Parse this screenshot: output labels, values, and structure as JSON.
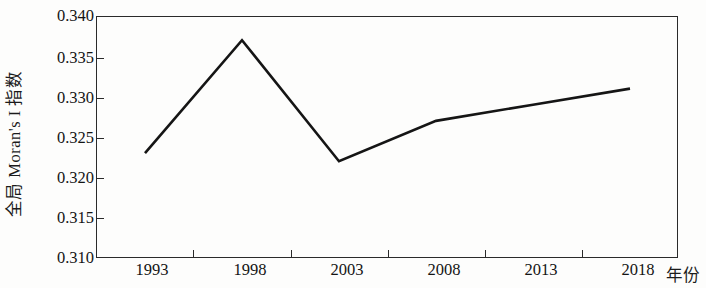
{
  "chart_data": {
    "type": "line",
    "title": "",
    "subtitle": "",
    "xlabel": "年份",
    "ylabel": "全局 Moran's I 指数",
    "x": [
      1993,
      1998,
      2003,
      2008,
      2013,
      2018
    ],
    "categories": [
      "1993",
      "1998",
      "2003",
      "2008",
      "2013",
      "2018"
    ],
    "values": [
      0.323,
      0.337,
      0.322,
      0.327,
      0.329,
      0.331
    ],
    "series": [
      {
        "name": "全局 Moran's I 指数",
        "values": [
          0.323,
          0.337,
          0.322,
          0.327,
          0.329,
          0.331
        ]
      }
    ],
    "ylim": [
      0.31,
      0.34
    ],
    "xlim": [
      1993,
      2018
    ],
    "yticks": [
      0.34,
      0.335,
      0.33,
      0.325,
      0.32,
      0.315,
      0.31
    ],
    "ytick_labels": [
      "0.340",
      "0.335",
      "0.330",
      "0.325",
      "0.320",
      "0.315",
      "0.310"
    ],
    "xtick_labels": [
      "1993",
      "1998",
      "2003",
      "2008",
      "2013",
      "2018"
    ],
    "grid": false,
    "legend": false,
    "legend_position": "none",
    "line_color": "#151515",
    "frame_color": "#2a2a2a",
    "background_color": "#fdfdfc",
    "annotations": []
  },
  "axes": {
    "y_title": "全局 Moran's I 指数",
    "x_title": "年份",
    "y_ticks": [
      {
        "label": "0.340",
        "value": 0.34
      },
      {
        "label": "0.335",
        "value": 0.335
      },
      {
        "label": "0.330",
        "value": 0.33
      },
      {
        "label": "0.325",
        "value": 0.325
      },
      {
        "label": "0.320",
        "value": 0.32
      },
      {
        "label": "0.315",
        "value": 0.315
      },
      {
        "label": "0.310",
        "value": 0.31
      }
    ],
    "x_ticks": [
      {
        "label": "1993",
        "value": 1993
      },
      {
        "label": "1998",
        "value": 1998
      },
      {
        "label": "2003",
        "value": 2003
      },
      {
        "label": "2008",
        "value": 2008
      },
      {
        "label": "2013",
        "value": 2013
      },
      {
        "label": "2018",
        "value": 2018
      }
    ]
  }
}
